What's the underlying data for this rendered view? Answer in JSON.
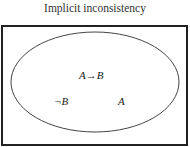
{
  "diagram": {
    "title": "Implicit inconsistency",
    "frame": {
      "x": 2,
      "y": 26,
      "width": 185,
      "height": 119,
      "stroke": "#222222"
    },
    "ellipse": {
      "cx": 95,
      "cy": 82,
      "rx": 84,
      "ry": 50,
      "stroke": "#444444"
    },
    "labels": [
      {
        "text": "A→B",
        "x": 79,
        "y": 69
      },
      {
        "text": "¬B",
        "x": 54,
        "y": 95
      },
      {
        "text": "A",
        "x": 118,
        "y": 95
      }
    ]
  }
}
